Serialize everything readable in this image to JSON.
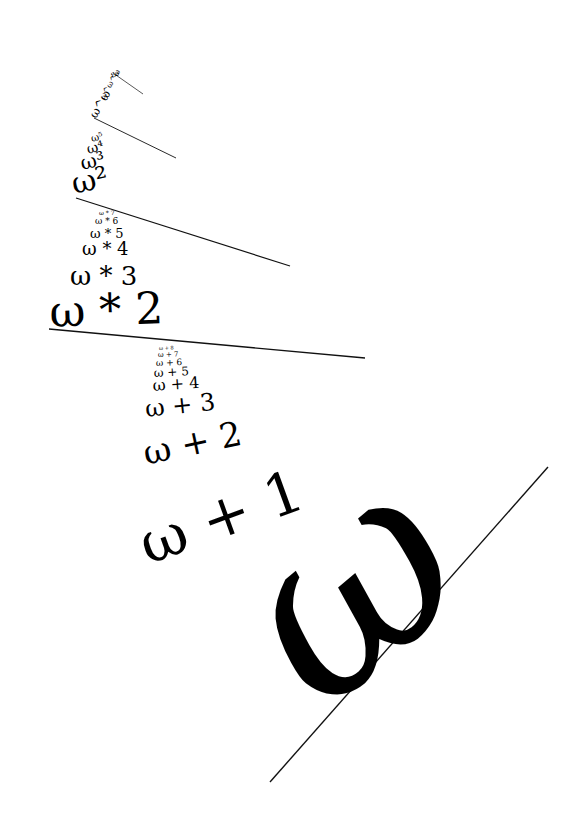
{
  "diagram": {
    "main_label": "ω",
    "arms": [
      {
        "name": "omega-plus-arm",
        "labels": [
          "ω + 1",
          "ω + 2",
          "ω + 3",
          "ω + 4",
          "ω + 5",
          "ω + 6",
          "ω + 7",
          "ω + 8"
        ]
      },
      {
        "name": "omega-times-arm",
        "labels": [
          "ω * 2",
          "ω * 3",
          "ω * 4",
          "ω * 5",
          "ω * 6",
          "ω * 7"
        ]
      },
      {
        "name": "omega-power-arm",
        "labels": [
          "ω²",
          "ω³",
          "ω⁴",
          "ω⁵"
        ]
      },
      {
        "name": "omega-omega-arm",
        "labels": [
          "ω^ω",
          "ω^ω^ω"
        ]
      },
      {
        "name": "epsilon-arm",
        "labels": [
          "ε₀"
        ]
      }
    ]
  }
}
